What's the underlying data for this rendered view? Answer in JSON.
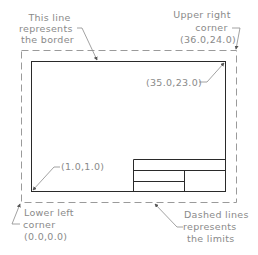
{
  "colors": {
    "background": "#ffffff",
    "border_line": "#2a2a2a",
    "limits_dash": "#9a9a9a",
    "label_text": "#8a8a8a",
    "leader": "#8a8a8a"
  },
  "labels": {
    "border": [
      "This line",
      "represents",
      "the border"
    ],
    "upper_right": [
      "Upper right",
      "corner",
      "(36.0,24.0)"
    ],
    "border_upper_right": "(35.0,23.0)",
    "border_lower_left": "(1.0,1.0)",
    "lower_left": [
      "Lower left",
      "corner",
      "(0.0,0.0)"
    ],
    "limits": [
      "Dashed lines",
      "represents",
      "the limits"
    ]
  }
}
